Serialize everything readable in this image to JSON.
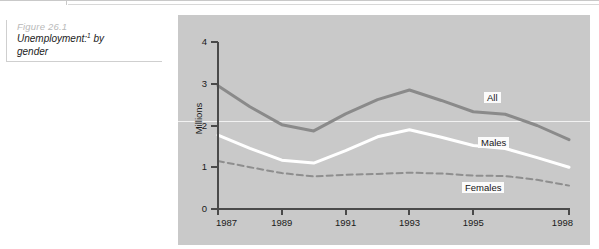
{
  "caption": {
    "figure_number": "Figure 26.1",
    "title_main": "Unemployment:",
    "title_sup": "1",
    "title_rest": " by gender"
  },
  "chart_data": {
    "type": "line",
    "title": "Unemployment:1 by gender",
    "xlabel": "",
    "ylabel": "Millions",
    "x": [
      1987,
      1988,
      1989,
      1990,
      1991,
      1992,
      1993,
      1994,
      1995,
      1996,
      1997,
      1998
    ],
    "tick_labels_x": [
      "1987",
      "1989",
      "1991",
      "1993",
      "1995",
      "1998"
    ],
    "tick_values_x": [
      1987,
      1989,
      1991,
      1993,
      1995,
      1998
    ],
    "tick_labels_y": [
      "0",
      "1",
      "2",
      "3",
      "4"
    ],
    "tick_values_y": [
      0,
      1,
      2,
      3,
      4
    ],
    "ylim": [
      0,
      4
    ],
    "xlim": [
      1987,
      1998
    ],
    "grid": true,
    "gridlines_y": [
      2.1
    ],
    "legend_position": "inline",
    "series": [
      {
        "name": "All",
        "color": "#8a8a8a",
        "style": "solid",
        "width": 3,
        "values": [
          2.95,
          2.45,
          2.02,
          1.87,
          2.28,
          2.62,
          2.85,
          2.6,
          2.33,
          2.27,
          2.0,
          1.66
        ],
        "label": "All",
        "label_x": 484,
        "label_y": 92
      },
      {
        "name": "Males",
        "color": "#ffffff",
        "style": "solid",
        "width": 3,
        "values": [
          1.77,
          1.45,
          1.17,
          1.1,
          1.4,
          1.73,
          1.9,
          1.72,
          1.52,
          1.45,
          1.23,
          1.0
        ],
        "label": "Males",
        "label_x": 478,
        "label_y": 137
      },
      {
        "name": "Females",
        "color": "#8e8e8e",
        "style": "dashed",
        "width": 2,
        "values": [
          1.15,
          1.0,
          0.86,
          0.78,
          0.82,
          0.84,
          0.87,
          0.85,
          0.8,
          0.79,
          0.7,
          0.56
        ],
        "label": "Females",
        "label_x": 462,
        "label_y": 182
      }
    ]
  }
}
